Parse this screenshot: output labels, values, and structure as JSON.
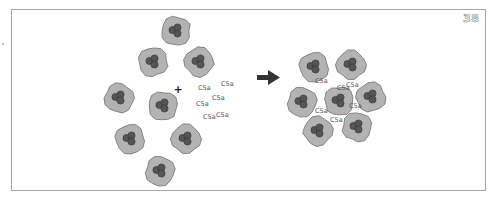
{
  "page_number": "38",
  "diagram": {
    "plus_symbol": "+",
    "arrow": "right-arrow-icon",
    "label_text": "C5a",
    "colors": {
      "cell_fill": "#b3b3b3",
      "cell_stroke": "#6e6e6e",
      "nucleus_fill": "#555555",
      "nucleus_stroke": "#333333",
      "arrow": "#333333",
      "frame": "#a6a6a6"
    },
    "left_panel": {
      "state": "dispersed",
      "cell_count": 8,
      "c5a_count": 6
    },
    "right_panel": {
      "state": "aggregated",
      "cell_count": 7,
      "c5a_count": 6
    }
  }
}
